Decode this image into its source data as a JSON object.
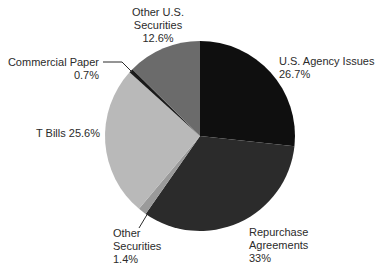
{
  "chart_data": {
    "type": "pie",
    "title": "",
    "start_angle_deg": 0,
    "direction": "clockwise",
    "center": [
      200,
      136
    ],
    "radius": 95,
    "slices": [
      {
        "name": "U.S. Agency Issues",
        "value": 26.7,
        "label": "26.7%",
        "color": "#0f0f0f"
      },
      {
        "name": "Repurchase Agreements",
        "value": 33.0,
        "label": "33%",
        "color": "#2b2b2b"
      },
      {
        "name": "Other Securities",
        "value": 1.4,
        "label": "1.4%",
        "color": "#9a9a9a"
      },
      {
        "name": "T Bills",
        "value": 25.6,
        "label": "25.6%",
        "color": "#b9b9b9"
      },
      {
        "name": "Commercial Paper",
        "value": 0.7,
        "label": "0.7%",
        "color": "#1a1a1a"
      },
      {
        "name": "Other U.S. Securities",
        "value": 12.6,
        "label": "12.6%",
        "color": "#6b6b6b"
      }
    ],
    "categories": [
      "U.S. Agency Issues",
      "Repurchase Agreements",
      "Other Securities",
      "T Bills",
      "Commercial Paper",
      "Other U.S. Securities"
    ],
    "values": [
      26.7,
      33,
      1.4,
      25.6,
      0.7,
      12.6
    ]
  },
  "labels": {
    "agency": {
      "line1": "U.S. Agency Issues",
      "line2": "26.7%"
    },
    "repo": {
      "line1": "Repurchase",
      "line2": "Agreements",
      "line3": "33%"
    },
    "other_sec": {
      "line1": "Other",
      "line2": "Securities",
      "line3": "1.4%"
    },
    "tbills": {
      "line1": "T Bills 25.6%"
    },
    "cp": {
      "line1": "Commercial Paper",
      "line2": "0.7%"
    },
    "other_us": {
      "line1": "Other U.S.",
      "line2": "Securities",
      "line3": "12.6%"
    }
  }
}
